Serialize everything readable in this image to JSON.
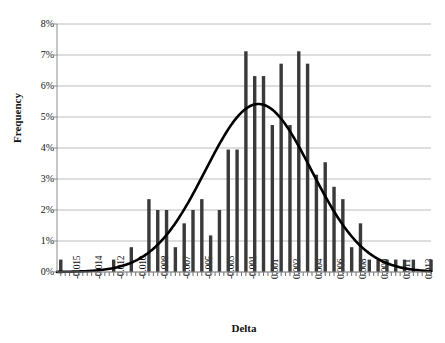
{
  "chart_data": {
    "type": "bar",
    "title": "",
    "subtitle": "",
    "xlabel": "Delta",
    "ylabel": "Frequency",
    "grid": true,
    "legend": "none",
    "ylim": [
      0,
      0.08
    ],
    "ytick_labels": [
      "8%",
      "7%",
      "6%",
      "5%",
      "4%",
      "3%",
      "2%",
      "1%",
      "0%"
    ],
    "ytick_values": [
      0.08,
      0.07,
      0.06,
      0.05,
      0.04,
      0.03,
      0.02,
      0.01,
      0.0
    ],
    "xtick_labels": [
      "-0.015",
      "-0.014",
      "-0.012",
      "-0.010",
      "-0.008",
      "-0.007",
      "-0.005",
      "-0.003",
      "-0.001",
      "0.001",
      "0.002",
      "0.004",
      "0.006",
      "0.008",
      "0.009",
      "0.011",
      "0.013"
    ],
    "xlim": [
      -0.0155,
      0.0142
    ],
    "bar_color": "#3a3a3a",
    "curve_color": "#000000",
    "grid_color": "#b4b4b4",
    "axis_color": "#808080",
    "categories": [
      -0.0152,
      -0.0145,
      -0.0138,
      -0.0131,
      -0.0124,
      -0.0117,
      -0.011,
      -0.0103,
      -0.0096,
      -0.0089,
      -0.0082,
      -0.0075,
      -0.0068,
      -0.0061,
      -0.0054,
      -0.0047,
      -0.004,
      -0.0033,
      -0.0026,
      -0.0019,
      -0.0012,
      -0.0005,
      0.0002,
      0.0009,
      0.0016,
      0.0023,
      0.003,
      0.0037,
      0.0044,
      0.0051,
      0.0058,
      0.0065,
      0.0072,
      0.0079,
      0.0086,
      0.0093,
      0.01,
      0.0107,
      0.0114,
      0.0121,
      0.0128,
      0.0135,
      0.0142
    ],
    "values": [
      0.004,
      0.0,
      0.0,
      0.0,
      0.0,
      0.0,
      0.004,
      0.0,
      0.008,
      0.0,
      0.0235,
      0.02,
      0.02,
      0.008,
      0.0157,
      0.02,
      0.0235,
      0.0118,
      0.02,
      0.0395,
      0.0395,
      0.0712,
      0.0632,
      0.0632,
      0.0474,
      0.0672,
      0.0474,
      0.0712,
      0.0672,
      0.0314,
      0.0354,
      0.0275,
      0.0235,
      0.008,
      0.0157,
      0.004,
      0.004,
      0.004,
      0.004,
      0.004,
      0.004,
      0.0,
      0.004
    ],
    "series": [
      {
        "name": "Frequency histogram",
        "type": "bar",
        "values": [
          0.004,
          0.0,
          0.0,
          0.0,
          0.0,
          0.0,
          0.004,
          0.0,
          0.008,
          0.0,
          0.0235,
          0.02,
          0.02,
          0.008,
          0.0157,
          0.02,
          0.0235,
          0.0118,
          0.02,
          0.0395,
          0.0395,
          0.0712,
          0.0632,
          0.0632,
          0.0474,
          0.0672,
          0.0474,
          0.0712,
          0.0672,
          0.0314,
          0.0354,
          0.0275,
          0.0235,
          0.008,
          0.0157,
          0.004,
          0.004,
          0.004,
          0.004,
          0.004,
          0.004,
          0.0,
          0.004
        ]
      },
      {
        "name": "Normal fit curve",
        "type": "line",
        "mean": 0.0005,
        "peak_value": 0.0542,
        "sigma": 0.0042
      }
    ]
  },
  "axes": {
    "y_title": "Frequency",
    "x_title": "Delta"
  }
}
